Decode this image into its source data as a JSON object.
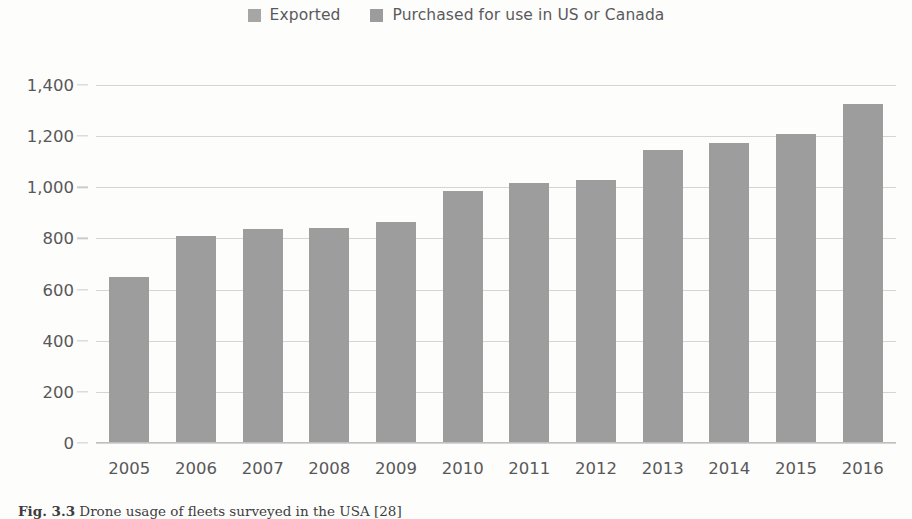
{
  "legend": {
    "position": "top-center",
    "items": [
      {
        "label": "Exported",
        "color": "#a3a3a4",
        "swatch_icon": "legend-swatch-square"
      },
      {
        "label": "Purchased for use in US or Canada",
        "color": "#9d9d9e",
        "swatch_icon": "legend-swatch-square"
      }
    ]
  },
  "caption": {
    "label": "Fig. 3.3",
    "text": "Drone usage of fleets surveyed in the USA [28]"
  },
  "colors": {
    "bar_purchased": "#9d9d9e",
    "bar_exported": "#a3a3a4",
    "gridline": "#d2d4d6",
    "axis": "#bdbfc1",
    "text": "#58585a",
    "background": "#fdfdfc"
  },
  "chart_data": {
    "type": "bar",
    "title": "",
    "subtitle": "",
    "xlabel": "",
    "ylabel": "",
    "categories": [
      "2005",
      "2006",
      "2007",
      "2008",
      "2009",
      "2010",
      "2011",
      "2012",
      "2013",
      "2014",
      "2015",
      "2016"
    ],
    "series": [
      {
        "name": "Exported",
        "color": "#a3a3a4",
        "values": [
          0,
          0,
          0,
          0,
          0,
          0,
          0,
          0,
          0,
          0,
          0,
          0
        ]
      },
      {
        "name": "Purchased for use in US or Canada",
        "color": "#9d9d9e",
        "values": [
          650,
          810,
          835,
          840,
          865,
          985,
          1015,
          1030,
          1145,
          1175,
          1210,
          1325
        ]
      }
    ],
    "totals": [
      650,
      810,
      835,
      840,
      865,
      985,
      1015,
      1030,
      1145,
      1175,
      1210,
      1325
    ],
    "ylim": [
      0,
      1400
    ],
    "ytick_values": [
      0,
      200,
      400,
      600,
      800,
      1000,
      1200,
      1400
    ],
    "ytick_labels": [
      "0",
      "200",
      "400",
      "600",
      "800",
      "1,000",
      "1,200",
      "1,400"
    ],
    "grid": true,
    "stacked": true,
    "legend_position": "top-center"
  }
}
